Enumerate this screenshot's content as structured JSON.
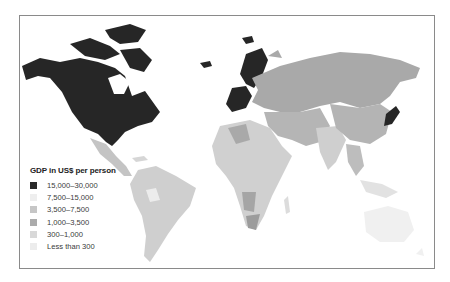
{
  "legend": {
    "title": "GDP in US$ per person",
    "items": [
      {
        "label": "15,000–30,000",
        "color": "#2a2a2a"
      },
      {
        "label": "7,500–15,000",
        "color": "#eeeeee"
      },
      {
        "label": "3,500–7,500",
        "color": "#c6c6c6"
      },
      {
        "label": "1,000–3,500",
        "color": "#ababab"
      },
      {
        "label": "300–1,000",
        "color": "#d8d8d8"
      },
      {
        "label": "Less than 300",
        "color": "#ececec"
      }
    ]
  },
  "regions": {
    "north_america": "15,000–30,000",
    "western_europe": "15,000–30,000",
    "scandinavia": "15,000–30,000",
    "japan": "15,000–30,000",
    "russia_central_asia": "1,000–3,500",
    "china_east_asia": "1,000–3,500",
    "south_america": "1,000–3,500",
    "africa_mixed": "300–1,000",
    "australia": "7,500–15,000"
  }
}
